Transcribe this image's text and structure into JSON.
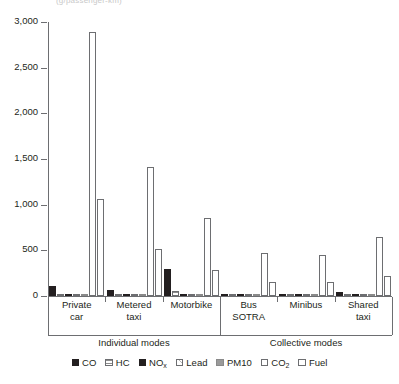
{
  "top_clipped_caption": "(g/passenger-km)",
  "chart_data": {
    "type": "bar",
    "title": "",
    "subtitle": "",
    "xlabel": "",
    "ylabel": "",
    "ylim": [
      0,
      3000
    ],
    "yticks": [
      0,
      500,
      1000,
      1500,
      2000,
      2500,
      3000
    ],
    "ytick_labels": [
      "0",
      "500",
      "1,000",
      "1,500",
      "2,000",
      "2,500",
      "3,000"
    ],
    "grid": false,
    "legend_position": "bottom",
    "categories": [
      "Private car",
      "Metered taxi",
      "Motorbike",
      "Bus SOTRA",
      "Minibus",
      "Shared taxi"
    ],
    "category_lines": [
      [
        "Private",
        "car"
      ],
      [
        "Metered",
        "taxi"
      ],
      [
        "Motorbike"
      ],
      [
        "Bus",
        "SOTRA"
      ],
      [
        "Minibus"
      ],
      [
        "Shared",
        "taxi"
      ]
    ],
    "supergroups": [
      {
        "label": "Individual modes",
        "categories": [
          "Private car",
          "Metered taxi",
          "Motorbike"
        ]
      },
      {
        "label": "Collective modes",
        "categories": [
          "Bus SOTRA",
          "Minibus",
          "Shared taxi"
        ]
      }
    ],
    "series": [
      {
        "name": "CO",
        "pattern": "solid-black",
        "values": [
          110,
          70,
          300,
          18,
          12,
          45
        ]
      },
      {
        "name": "HC",
        "pattern": "horizontal-lines",
        "values": [
          18,
          14,
          55,
          5,
          4,
          9
        ]
      },
      {
        "name": "NOx",
        "pattern": "solid-black",
        "values": [
          14,
          9,
          6,
          12,
          8,
          10
        ]
      },
      {
        "name": "Lead",
        "pattern": "crosshatch",
        "values": [
          5,
          4,
          3,
          2,
          2,
          3
        ]
      },
      {
        "name": "PM10",
        "pattern": "solid-gray",
        "values": [
          6,
          5,
          4,
          6,
          5,
          5
        ]
      },
      {
        "name": "CO2",
        "pattern": "open",
        "values": [
          2890,
          1410,
          850,
          470,
          450,
          650
        ]
      },
      {
        "name": "Fuel",
        "pattern": "open",
        "values": [
          1060,
          520,
          280,
          155,
          150,
          215
        ]
      }
    ]
  },
  "legend": {
    "items": [
      {
        "label": "CO",
        "sub": "",
        "pattern": "solid-black"
      },
      {
        "label": "HC",
        "sub": "",
        "pattern": "horizontal-lines"
      },
      {
        "label": "NO",
        "sub": "x",
        "pattern": "solid-black"
      },
      {
        "label": "Lead",
        "sub": "",
        "pattern": "crosshatch"
      },
      {
        "label": "PM10",
        "sub": "",
        "pattern": "solid-gray"
      },
      {
        "label": "CO",
        "sub": "2",
        "pattern": "open"
      },
      {
        "label": "Fuel",
        "sub": "",
        "pattern": "open"
      }
    ]
  },
  "colors": {
    "axis": "#6d6e71",
    "text": "#231f20",
    "dark_fill": "#231f20",
    "gray_fill": "#9a9a9a",
    "open_fill": "#ffffff"
  }
}
